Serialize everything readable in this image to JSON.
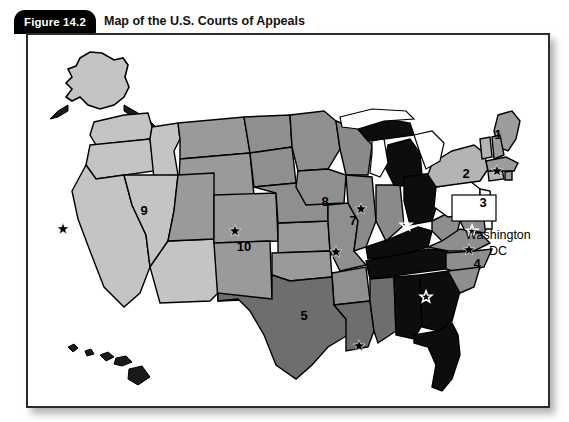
{
  "figure": {
    "tab_label": "Figure 14.2",
    "title": "Map of the U.S. Courts of Appeals"
  },
  "map": {
    "annotations": {
      "washington_dc_line1": "Washington",
      "washington_dc_line2": "DC"
    },
    "circuit_labels": [
      {
        "id": "circuit-1",
        "text": "1",
        "x": 470,
        "y": 104,
        "tone": "dark"
      },
      {
        "id": "circuit-2",
        "text": "2",
        "x": 438,
        "y": 143,
        "tone": "dark"
      },
      {
        "id": "circuit-3",
        "text": "3",
        "x": 455,
        "y": 172,
        "tone": "dark"
      },
      {
        "id": "circuit-4",
        "text": "4",
        "x": 449,
        "y": 233,
        "tone": "dark"
      },
      {
        "id": "circuit-5",
        "text": "5",
        "x": 276,
        "y": 285,
        "tone": "dark"
      },
      {
        "id": "circuit-7",
        "text": "7",
        "x": 325,
        "y": 190,
        "tone": "dark"
      },
      {
        "id": "circuit-8",
        "text": "8",
        "x": 297,
        "y": 171,
        "tone": "dark"
      },
      {
        "id": "circuit-9",
        "text": "9",
        "x": 116,
        "y": 180,
        "tone": "dark"
      },
      {
        "id": "circuit-10",
        "text": "10",
        "x": 216,
        "y": 216,
        "tone": "dark"
      }
    ],
    "court_seat_markers": [
      {
        "id": "seat-san-francisco",
        "x": 35,
        "y": 194,
        "style": "solid"
      },
      {
        "id": "seat-denver",
        "x": 207,
        "y": 196,
        "style": "solid"
      },
      {
        "id": "seat-st-louis",
        "x": 308,
        "y": 217,
        "style": "solid"
      },
      {
        "id": "seat-chicago",
        "x": 333,
        "y": 174,
        "style": "solid"
      },
      {
        "id": "seat-new-orleans",
        "x": 331,
        "y": 311,
        "style": "solid"
      },
      {
        "id": "seat-boston",
        "x": 469,
        "y": 136,
        "style": "solid"
      },
      {
        "id": "seat-philadelphia",
        "x": 444,
        "y": 196,
        "style": "outline"
      },
      {
        "id": "seat-richmond",
        "x": 441,
        "y": 215,
        "style": "solid"
      },
      {
        "id": "seat-cincinnati",
        "x": 378,
        "y": 190,
        "style": "outline"
      },
      {
        "id": "seat-atlanta",
        "x": 398,
        "y": 262,
        "style": "outline"
      }
    ],
    "shades": {
      "circuit_1": "#9c9c9c",
      "circuit_2": "#b4b4b4",
      "circuit_3": "#ffffff",
      "circuit_4": "#8e8e8e",
      "circuit_5": "#6e6e6e",
      "circuit_6": "#0d0d0d",
      "circuit_7": "#8a8a8a",
      "circuit_8": "#8f8f8f",
      "circuit_9": "#c4c4c4",
      "circuit_10": "#9a9a9a",
      "circuit_11": "#0d0d0d",
      "outline": "#000000"
    }
  }
}
